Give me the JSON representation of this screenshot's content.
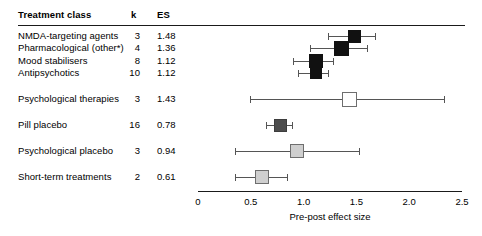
{
  "header": {
    "treatment_class": "Treatment class",
    "k": "k",
    "es": "ES"
  },
  "chart_data": {
    "type": "bar",
    "subtype": "forest-plot",
    "title": "",
    "xlabel": "Pre-post effect size",
    "ylabel": "",
    "xlim": [
      0,
      2.5
    ],
    "xticks": [
      "0",
      "0.5",
      "1.0",
      "1.5",
      "2.0",
      "2.5"
    ],
    "xtick_values": [
      0,
      0.5,
      1.0,
      1.5,
      2.0,
      2.5
    ],
    "grid": false,
    "legend": "none",
    "columns": [
      "Treatment class",
      "k",
      "ES"
    ],
    "rows": [
      {
        "label": "NMDA-targeting agents",
        "k": "3",
        "es": "1.48",
        "es_value": 1.48,
        "ci_low": 1.23,
        "ci_high": 1.68,
        "marker": "filled-black",
        "marker_size": 13,
        "top": 36
      },
      {
        "label": "Pharmacological (other*)",
        "k": "4",
        "es": "1.36",
        "es_value": 1.36,
        "ci_low": 1.06,
        "ci_high": 1.6,
        "marker": "filled-black",
        "marker_size": 15,
        "top": 48
      },
      {
        "label": "Mood stabilisers",
        "k": "8",
        "es": "1.12",
        "es_value": 1.12,
        "ci_low": 0.9,
        "ci_high": 1.28,
        "marker": "filled-black",
        "marker_size": 14,
        "top": 61
      },
      {
        "label": "Antipsychotics",
        "k": "10",
        "es": "1.12",
        "es_value": 1.12,
        "ci_low": 0.95,
        "ci_high": 1.23,
        "marker": "filled-black",
        "marker_size": 12,
        "top": 73
      },
      {
        "label": "Psychological therapies",
        "k": "3",
        "es": "1.43",
        "es_value": 1.43,
        "ci_low": 0.49,
        "ci_high": 2.33,
        "marker": "open-white",
        "marker_size": 15,
        "top": 99
      },
      {
        "label": "Pill placebo",
        "k": "16",
        "es": "0.78",
        "es_value": 0.78,
        "ci_low": 0.64,
        "ci_high": 0.89,
        "marker": "filled-gray",
        "marker_size": 13,
        "top": 125
      },
      {
        "label": "Psychological placebo",
        "k": "3",
        "es": "0.94",
        "es_value": 0.94,
        "ci_low": 0.35,
        "ci_high": 1.52,
        "marker": "open-gray",
        "marker_size": 14,
        "top": 151
      },
      {
        "label": "Short-term treatments",
        "k": "2",
        "es": "0.61",
        "es_value": 0.61,
        "ci_low": 0.35,
        "ci_high": 0.84,
        "marker": "open-gray",
        "marker_size": 14,
        "top": 177
      }
    ]
  },
  "axis": {
    "x_origin_px": 198,
    "px_per_unit": 105.6
  }
}
